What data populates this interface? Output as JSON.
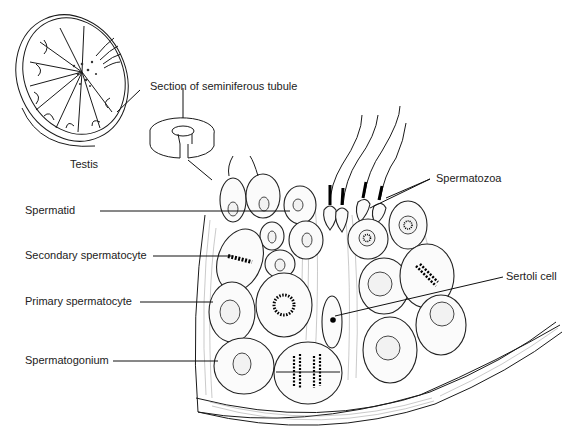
{
  "figure": {
    "labels": {
      "testis": "Testis",
      "section": "Section of seminiferous tubule",
      "spermatozoa": "Spermatozoa",
      "spermatid": "Spermatid",
      "secondary_spermatocyte": "Secondary spermatocyte",
      "primary_spermatocyte": "Primary spermatocyte",
      "sertoli_cell": "Sertoli cell",
      "spermatogonium": "Spermatogonium"
    },
    "colors": {
      "ink": "#1a1a1a",
      "background": "#ffffff",
      "cell_fill": "#fbfbfb"
    }
  }
}
